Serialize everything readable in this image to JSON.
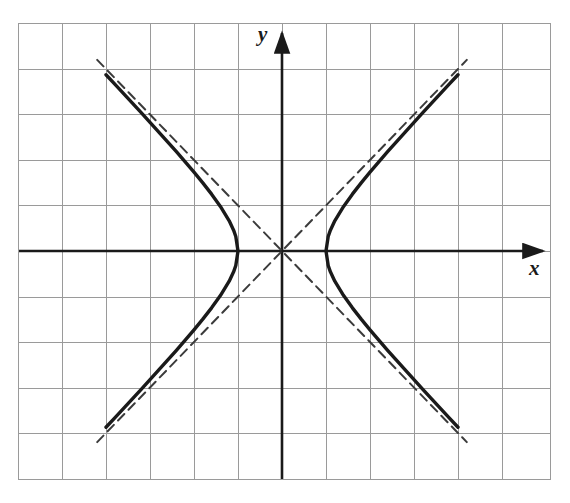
{
  "figure": {
    "name": "hyperbola-graph",
    "background_color": "#ffffff",
    "axis_color": "#1a1a1a",
    "curve_color": "#1a1a1a",
    "asymptote_color": "#3b3b3b",
    "grid_color": "#9a9a9a"
  },
  "axes": {
    "x_label": "x",
    "y_label": "y",
    "origin_px": [
      282,
      251
    ],
    "unit_px_x": 44,
    "unit_px_y": 45.5,
    "x_axis_arrow": true,
    "y_axis_arrow": true
  },
  "grid": {
    "visible": true,
    "left_px": 18,
    "right_px": 550,
    "top_px": 23,
    "bottom_px": 479,
    "columns": 12,
    "rows": 10,
    "x_lines_px": [
      18,
      62,
      106,
      150,
      194,
      238,
      282,
      326,
      370,
      414,
      458,
      502,
      550
    ],
    "y_lines_px": [
      23,
      69,
      114,
      160,
      205,
      251,
      297,
      342,
      388,
      433,
      479
    ]
  },
  "chart_data": {
    "type": "line",
    "title": "",
    "xlabel": "x",
    "ylabel": "y",
    "grid": true,
    "legend": null,
    "xlim": [
      -6,
      6.1
    ],
    "ylim": [
      -5,
      5
    ],
    "equation": "x^2 - y^2 = 1",
    "vertices": [
      [
        -1,
        0
      ],
      [
        1,
        0
      ]
    ],
    "series": [
      {
        "name": "hyperbola-left-branch",
        "style": "solid",
        "x": [
          -4.0,
          -3.8,
          -3.6,
          -3.4,
          -3.2,
          -3.0,
          -2.8,
          -2.6,
          -2.4,
          -2.2,
          -2.0,
          -1.8,
          -1.6,
          -1.4,
          -1.2,
          -1.1,
          -1.05,
          -1.0,
          -1.05,
          -1.1,
          -1.2,
          -1.4,
          -1.6,
          -1.8,
          -2.0,
          -2.2,
          -2.4,
          -2.6,
          -2.8,
          -3.0,
          -3.2,
          -3.4,
          -3.6,
          -3.8,
          -4.0
        ],
        "y": [
          3.873,
          3.666,
          3.458,
          3.25,
          3.04,
          2.828,
          2.615,
          2.4,
          2.182,
          1.96,
          1.732,
          1.497,
          1.249,
          0.98,
          0.663,
          0.458,
          0.32,
          0.0,
          -0.32,
          -0.458,
          -0.663,
          -0.98,
          -1.249,
          -1.497,
          -1.732,
          -1.96,
          -2.182,
          -2.4,
          -2.615,
          -2.828,
          -3.04,
          -3.25,
          -3.458,
          -3.666,
          -3.873
        ]
      },
      {
        "name": "hyperbola-right-branch",
        "style": "solid",
        "x": [
          4.0,
          3.8,
          3.6,
          3.4,
          3.2,
          3.0,
          2.8,
          2.6,
          2.4,
          2.2,
          2.0,
          1.8,
          1.6,
          1.4,
          1.2,
          1.1,
          1.05,
          1.0,
          1.05,
          1.1,
          1.2,
          1.4,
          1.6,
          1.8,
          2.0,
          2.2,
          2.4,
          2.6,
          2.8,
          3.0,
          3.2,
          3.4,
          3.6,
          3.8,
          4.0
        ],
        "y": [
          3.873,
          3.666,
          3.458,
          3.25,
          3.04,
          2.828,
          2.615,
          2.4,
          2.182,
          1.96,
          1.732,
          1.497,
          1.249,
          0.98,
          0.663,
          0.458,
          0.32,
          0.0,
          -0.32,
          -0.458,
          -0.663,
          -0.98,
          -1.249,
          -1.497,
          -1.732,
          -1.96,
          -2.182,
          -2.4,
          -2.615,
          -2.828,
          -3.04,
          -3.25,
          -3.458,
          -3.666,
          -3.873
        ]
      },
      {
        "name": "asymptote-positive-slope",
        "style": "dashed",
        "x": [
          -4.2,
          4.2
        ],
        "y": [
          -4.2,
          4.2
        ]
      },
      {
        "name": "asymptote-negative-slope",
        "style": "dashed",
        "x": [
          -4.2,
          4.2
        ],
        "y": [
          4.2,
          -4.2
        ]
      }
    ]
  }
}
